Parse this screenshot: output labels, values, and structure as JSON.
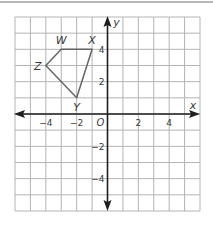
{
  "chart_data": {
    "type": "scatter",
    "title": "",
    "xlabel": "x",
    "ylabel": "y",
    "xlim": [
      -6,
      6
    ],
    "ylim": [
      -6,
      6
    ],
    "grid": true,
    "origin_label": "O",
    "x_tick_labels": [
      {
        "value": -4,
        "label": "−4"
      },
      {
        "value": -2,
        "label": "−2"
      },
      {
        "value": 2,
        "label": "2"
      },
      {
        "value": 4,
        "label": "4"
      }
    ],
    "y_tick_labels": [
      {
        "value": 4,
        "label": "4"
      },
      {
        "value": 2,
        "label": "2"
      },
      {
        "value": -2,
        "label": "−2"
      },
      {
        "value": -4,
        "label": "−4"
      }
    ],
    "polygon": {
      "name": "WXYZ",
      "vertices": [
        {
          "label": "W",
          "x": -3,
          "y": 4
        },
        {
          "label": "X",
          "x": -1,
          "y": 4
        },
        {
          "label": "Y",
          "x": -2,
          "y": 1
        },
        {
          "label": "Z",
          "x": -4,
          "y": 3
        }
      ]
    }
  },
  "colors": {
    "grid": "#b4b4b4",
    "axis": "#1e1e1e",
    "polygon": "#666666",
    "text": "#3a3a3a"
  }
}
